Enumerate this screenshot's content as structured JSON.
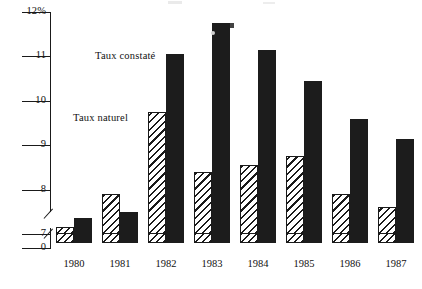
{
  "chart_data": {
    "type": "bar",
    "title": "",
    "xlabel": "",
    "ylabel": "",
    "categories": [
      "1980",
      "1981",
      "1982",
      "1983",
      "1984",
      "1985",
      "1986",
      "1987"
    ],
    "ytick_labels": [
      "12%",
      "11",
      "10",
      "9",
      "8",
      "7",
      "0"
    ],
    "ytick_values": [
      12,
      11,
      10,
      9,
      8,
      7,
      0
    ],
    "ylim": [
      7,
      12
    ],
    "axis_break": true,
    "axis_break_between": [
      0,
      7
    ],
    "grid": false,
    "legend_position": "inside-left",
    "series": [
      {
        "name": "Taux naturel",
        "fill": "hatched",
        "values": [
          7.15,
          7.9,
          9.75,
          8.4,
          8.55,
          8.75,
          7.9,
          7.6
        ]
      },
      {
        "name": "Taux constaté",
        "fill": "solid-black",
        "values": [
          7.35,
          7.5,
          11.05,
          11.75,
          11.15,
          10.45,
          9.6,
          9.15
        ]
      }
    ]
  },
  "legend": {
    "constate_label": "Taux constaté",
    "naturel_label": "Taux naturel"
  },
  "colors": {
    "ink": "#1a1a1a",
    "solid_bar": "#1c1c1c",
    "background": "#ffffff"
  }
}
